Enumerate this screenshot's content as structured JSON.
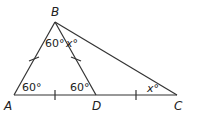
{
  "diagram": {
    "vertices": {
      "A": {
        "label": "A",
        "x": 14,
        "y": 95
      },
      "B": {
        "label": "B",
        "x": 55,
        "y": 22
      },
      "C": {
        "label": "C",
        "x": 177,
        "y": 95
      },
      "D": {
        "label": "D",
        "x": 96,
        "y": 95
      }
    },
    "angles": {
      "A": "60°",
      "ABD": "60°",
      "ADB": "60°",
      "DBC": "x°",
      "C": "x°"
    },
    "line_color": "#333333"
  }
}
